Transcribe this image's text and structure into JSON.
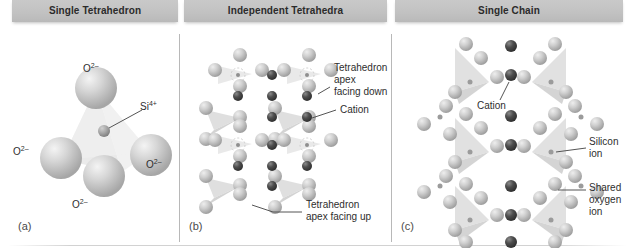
{
  "figure": {
    "headers": [
      {
        "id": "single-tetrahedron",
        "label": "Single Tetrahedron"
      },
      {
        "id": "independent-tetrahedra",
        "label": "Independent Tetrahedra"
      },
      {
        "id": "single-chain",
        "label": "Single Chain"
      }
    ],
    "panel_letters": [
      "(a)",
      "(b)",
      "(c)"
    ],
    "colors": {
      "header_bar": "#c2c2c2",
      "header_text": "#2b2b2b",
      "oxygen_sphere": "#c8c8c8",
      "silicon_sphere": "#9a9a9a",
      "cation_sphere": "#4a4a4a",
      "tetra_face": "#d8d8d8",
      "divider": "#b8b8b8",
      "label_text": "#2e2e2e",
      "background": "#ffffff"
    }
  },
  "panel_a": {
    "letter": "(a)",
    "title": "Single Tetrahedron",
    "labels": {
      "oxygen_top": "O",
      "oxygen_top_charge": "2–",
      "oxygen_left": "O",
      "oxygen_left_charge": "2–",
      "oxygen_right": "O",
      "oxygen_right_charge": "2–",
      "oxygen_bottom": "O",
      "oxygen_bottom_charge": "2–",
      "silicon": "Si",
      "silicon_charge": "4+"
    }
  },
  "panel_b": {
    "letter": "(b)",
    "title": "Independent Tetrahedra",
    "annotations": [
      {
        "id": "apex-down",
        "text": "Tetrahedron\napex\nfacing down"
      },
      {
        "id": "cation",
        "text": "Cation"
      },
      {
        "id": "apex-up",
        "text": "Tetrahedron\napex facing up"
      }
    ]
  },
  "panel_c": {
    "letter": "(c)",
    "title": "Single Chain",
    "annotations": [
      {
        "id": "cation",
        "text": "Cation"
      },
      {
        "id": "silicon-ion",
        "text": "Silicon\nion"
      },
      {
        "id": "shared-oxygen-ion",
        "text": "Shared\noxygen ion"
      }
    ]
  }
}
